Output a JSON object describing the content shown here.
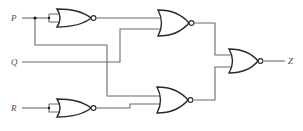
{
  "diagram": {
    "type": "logic-circuit",
    "gate_type": "NOR",
    "inputs": [
      {
        "id": "P",
        "label": "P"
      },
      {
        "id": "Q",
        "label": "Q"
      },
      {
        "id": "R",
        "label": "R"
      }
    ],
    "output": {
      "id": "Z",
      "label": "Z"
    },
    "gates": [
      {
        "id": "G1",
        "type": "NOR",
        "inputs": [
          "P",
          "P"
        ]
      },
      {
        "id": "G2",
        "type": "NOR",
        "inputs": [
          "G1",
          "Q"
        ]
      },
      {
        "id": "G3",
        "type": "NOR",
        "inputs": [
          "R",
          "R"
        ]
      },
      {
        "id": "G4",
        "type": "NOR",
        "inputs": [
          "P",
          "G3"
        ]
      },
      {
        "id": "G5",
        "type": "NOR",
        "inputs": [
          "G2",
          "G4"
        ],
        "output": "Z"
      }
    ],
    "colors": {
      "wire": "#6b6b6b",
      "gate_outline": "#2a2a2a",
      "background": "#ffffff"
    }
  }
}
